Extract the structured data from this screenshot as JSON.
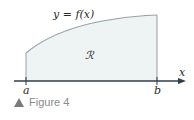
{
  "figure": {
    "curve_label": "y = f(x)",
    "region_label": "ℛ",
    "x_axis_label": "x",
    "left_bound_label": "a",
    "right_bound_label": "b",
    "caption": "Figure 4",
    "caption_icon": "triangle-up-icon",
    "colors": {
      "region_fill": "#eef3f4",
      "curve": "#9aa0a4",
      "axis": "#2f3e4a",
      "caption": "#8a8a8a"
    }
  }
}
